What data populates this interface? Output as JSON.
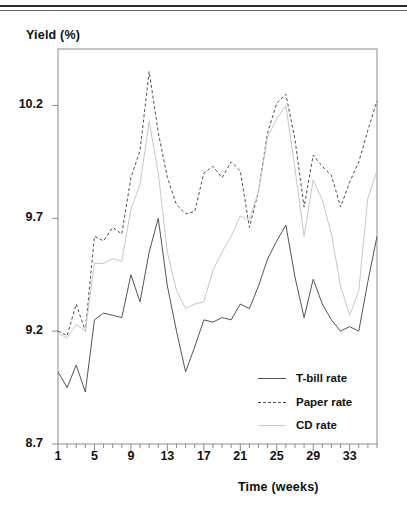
{
  "chart_data": {
    "type": "line",
    "title": "",
    "xlabel": "Time (weeks)",
    "ylabel": "Yield (%)",
    "xlim": [
      1,
      36
    ],
    "ylim": [
      8.7,
      10.45
    ],
    "grid": false,
    "legend_position": "inside-bottom-right",
    "ytick_labels": [
      "8.7",
      "9.2",
      "9.7",
      "10.2"
    ],
    "yticks": [
      8.7,
      9.2,
      9.7,
      10.2
    ],
    "xtick_labels": [
      "1",
      "5",
      "9",
      "13",
      "17",
      "21",
      "25",
      "29",
      "33"
    ],
    "xticks": [
      1,
      5,
      9,
      13,
      17,
      21,
      25,
      29,
      33
    ],
    "x": [
      1,
      2,
      3,
      4,
      5,
      6,
      7,
      8,
      9,
      10,
      11,
      12,
      13,
      14,
      15,
      16,
      17,
      18,
      19,
      20,
      21,
      22,
      23,
      24,
      25,
      26,
      27,
      28,
      29,
      30,
      31,
      32,
      33,
      34,
      35,
      36
    ],
    "series": [
      {
        "name": "T-bill rate",
        "style": "solid",
        "color": "#555555",
        "values": [
          9.02,
          8.95,
          9.05,
          8.93,
          9.25,
          9.28,
          9.27,
          9.26,
          9.45,
          9.33,
          9.55,
          9.7,
          9.4,
          9.2,
          9.02,
          9.13,
          9.25,
          9.24,
          9.26,
          9.25,
          9.32,
          9.3,
          9.4,
          9.52,
          9.6,
          9.67,
          9.44,
          9.26,
          9.43,
          9.32,
          9.25,
          9.2,
          9.22,
          9.2,
          9.42,
          9.62
        ]
      },
      {
        "name": "Paper rate",
        "style": "dashed",
        "color": "#4d4d4d",
        "values": [
          9.2,
          9.18,
          9.32,
          9.2,
          9.62,
          9.6,
          9.66,
          9.63,
          9.88,
          10.0,
          10.35,
          10.08,
          9.88,
          9.76,
          9.72,
          9.73,
          9.9,
          9.93,
          9.88,
          9.95,
          9.91,
          9.66,
          9.82,
          10.08,
          10.21,
          10.25,
          10.05,
          9.75,
          9.98,
          9.93,
          9.89,
          9.75,
          9.86,
          9.95,
          10.09,
          10.22
        ]
      },
      {
        "name": "CD rate",
        "style": "solid-light",
        "color": "#c8c8c8",
        "values": [
          9.19,
          9.17,
          9.23,
          9.2,
          9.5,
          9.5,
          9.52,
          9.51,
          9.74,
          9.85,
          10.13,
          9.9,
          9.55,
          9.38,
          9.3,
          9.32,
          9.33,
          9.47,
          9.55,
          9.62,
          9.71,
          9.69,
          9.82,
          10.06,
          10.14,
          10.2,
          9.92,
          9.62,
          9.87,
          9.78,
          9.63,
          9.4,
          9.27,
          9.38,
          9.79,
          9.91
        ]
      }
    ]
  },
  "axis": {
    "ylabel": "Yield (%)",
    "xlabel": "Time (weeks)"
  },
  "legend": {
    "items": [
      {
        "label": "T-bill rate",
        "style": "solid"
      },
      {
        "label": "Paper rate",
        "style": "dashed"
      },
      {
        "label": "CD rate",
        "style": "solid-light"
      }
    ]
  }
}
